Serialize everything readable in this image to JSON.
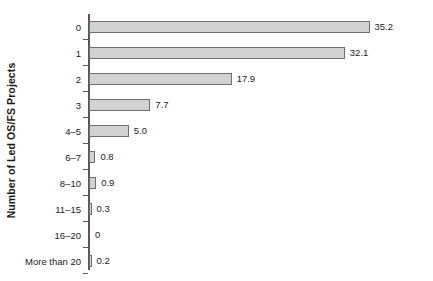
{
  "chart_data": {
    "type": "bar",
    "orientation": "horizontal",
    "title": "",
    "xlabel": "",
    "ylabel": "Number of Led OS/FS Projects",
    "categories": [
      "0",
      "1",
      "2",
      "3",
      "4–5",
      "6–7",
      "8–10",
      "11–15",
      "16–20",
      "More than 20"
    ],
    "values": [
      35.2,
      32.1,
      17.9,
      7.7,
      5.0,
      0.8,
      0.9,
      0.3,
      0,
      0.2
    ],
    "value_labels": [
      "35.2",
      "32.1",
      "17.9",
      "7.7",
      "5.0",
      "0.8",
      "0.9",
      "0.3",
      "0",
      "0.2"
    ],
    "xlim": [
      0,
      35.2
    ],
    "grid": false,
    "legend": null,
    "axis_ticks_x": [],
    "bar_fill_color": "#d2d2d2",
    "bar_border_color": "#6e6e6e",
    "axis_color": "#585858",
    "text_color": "#1a1a1a"
  }
}
